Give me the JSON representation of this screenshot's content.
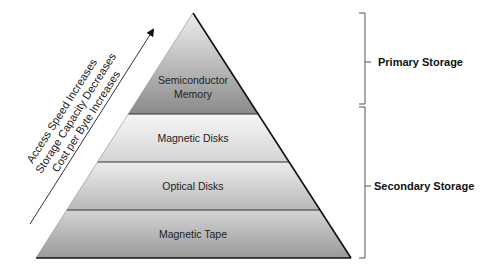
{
  "diagram": {
    "levels": [
      {
        "label_lines": [
          "Semiconductor",
          "Memory"
        ],
        "fill_top": "#e2e2e2",
        "fill_bottom": "#8c8c8c"
      },
      {
        "label_lines": [
          "Magnetic Disks"
        ],
        "fill_top": "#f4f4f4",
        "fill_bottom": "#d6d6d6"
      },
      {
        "label_lines": [
          "Optical Disks"
        ],
        "fill_top": "#ebebeb",
        "fill_bottom": "#bdbdbd"
      },
      {
        "label_lines": [
          "Magnetic Tape"
        ],
        "fill_top": "#d2d2d2",
        "fill_bottom": "#9e9e9e"
      }
    ],
    "arrow_labels": [
      "Access Speed Increases",
      "Storage Capacity Decreases",
      "Cost per Byte Increases"
    ],
    "groups": [
      {
        "label": "Primary Storage",
        "covers": [
          "Semiconductor Memory"
        ]
      },
      {
        "label": "Secondary Storage",
        "covers": [
          "Magnetic Disks",
          "Optical Disks",
          "Magnetic Tape"
        ]
      }
    ],
    "colors": {
      "outline": "#111111",
      "divider": "#333333",
      "bracket": "#555555"
    }
  }
}
